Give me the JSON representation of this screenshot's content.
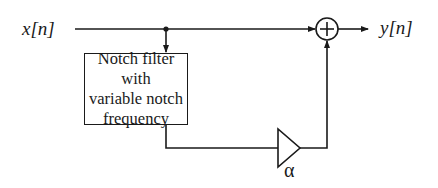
{
  "diagram": {
    "input_label": "x[n]",
    "output_label": "y[n]",
    "filter_block": {
      "lines": [
        "Notch filter with",
        "variable notch",
        "frequency"
      ]
    },
    "sum_symbol": "+",
    "gain_label": "α",
    "stroke_color": "#1a1a1a"
  }
}
